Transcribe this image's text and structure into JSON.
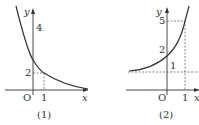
{
  "figures": [
    {
      "caption": "(1)",
      "axis_labels": {
        "x": "x",
        "y": "y",
        "origin": "O"
      },
      "tick_labels": {
        "x1": "1",
        "y_a": "2",
        "y_b": "4"
      },
      "description": "Decreasing curve crossing y-axis, dashed guides at x=1 and y=2, label 4 on y-axis"
    },
    {
      "caption": "(2)",
      "axis_labels": {
        "x": "x",
        "y": "y",
        "origin": "O"
      },
      "tick_labels": {
        "x1": "1",
        "y_a": "1",
        "y_b": "2",
        "y_c": "5"
      },
      "description": "Increasing curve with horizontal asymptote dashed line at y=1, dashed guides at x=1 and y=5, label 2 near y-intercept"
    }
  ],
  "colors": {
    "stroke": "#333333",
    "dash": "#555555",
    "background": "#ffffff"
  }
}
